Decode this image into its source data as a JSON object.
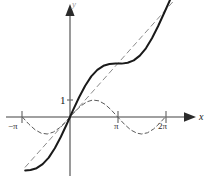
{
  "figure": {
    "title": "Graph of y = x + sin x with y = x and y = sin x",
    "background_color": "#ffffff",
    "width": 211,
    "height": 182
  },
  "axes": {
    "x_axis_label": "x",
    "y_axis_label": "y",
    "origin_px": {
      "x": 70,
      "y": 117
    },
    "x_unit_px": 47.7,
    "y_unit_px": 17.0,
    "xlim": [
      -1.47,
      2.62
    ],
    "ylim": [
      -3.9,
      6.9
    ],
    "grid": false,
    "x_ticks": [
      {
        "value": -3.14159,
        "label": "−π",
        "px_x": 22
      },
      {
        "value": 3.14159,
        "label": "π",
        "px_x": 118
      },
      {
        "value": 6.28319,
        "label": "2π",
        "px_x": 166
      }
    ],
    "y_ticks": [
      {
        "value": 1,
        "label": "1",
        "px_y": 100
      }
    ]
  },
  "chart_data": {
    "type": "line",
    "title": "",
    "xlabel": "x",
    "ylabel": "y",
    "xlim": [
      -4.62,
      8.22
    ],
    "ylim": [
      -6.6,
      11.7
    ],
    "grid": false,
    "legend_position": "none",
    "series": [
      {
        "name": "y = x + sin x",
        "style": "solid",
        "color": "#1a1a1a",
        "expression": "x + sin(x)",
        "x": [
          -2.95,
          -2.6,
          -2.2,
          -1.8,
          -1.4,
          -1.0,
          -0.6,
          -0.2,
          0.0,
          0.2,
          0.6,
          1.0,
          1.4,
          1.8,
          2.2,
          2.6,
          3.0,
          3.4,
          3.8,
          4.2,
          4.6,
          5.0,
          5.4,
          5.8,
          6.2,
          6.6,
          6.95
        ],
        "y": [
          -3.14,
          -3.12,
          -3.01,
          -2.77,
          -2.39,
          -1.84,
          -1.16,
          -0.4,
          0.0,
          0.4,
          1.16,
          1.84,
          2.39,
          2.77,
          3.01,
          3.12,
          3.14,
          3.14,
          3.19,
          3.33,
          3.61,
          4.04,
          4.63,
          5.34,
          6.12,
          6.91,
          7.56
        ]
      },
      {
        "name": "y = x",
        "style": "dashed",
        "color": "#8a8a8a",
        "expression": "x",
        "x": [
          -2.95,
          6.95
        ],
        "y": [
          -2.95,
          6.95
        ]
      },
      {
        "name": "y = sin x",
        "style": "dashed",
        "color": "#5a5a5a",
        "expression": "sin(x)",
        "x": [
          -3.14,
          -2.7,
          -2.3,
          -1.9,
          -1.5,
          -1.1,
          -0.7,
          -0.3,
          0.0,
          0.3,
          0.7,
          1.1,
          1.5,
          1.9,
          2.3,
          2.7,
          3.14,
          3.6,
          4.0,
          4.4,
          4.71,
          5.1,
          5.5,
          5.9,
          6.28
        ],
        "y": [
          0.0,
          -0.43,
          -0.75,
          -0.95,
          -1.0,
          -0.89,
          -0.64,
          -0.3,
          0.0,
          0.3,
          0.64,
          0.89,
          1.0,
          0.95,
          0.75,
          0.43,
          0.0,
          -0.44,
          -0.76,
          -0.95,
          -1.0,
          -0.93,
          -0.71,
          -0.37,
          0.0
        ]
      }
    ],
    "annotations": [
      {
        "text": "1",
        "x": -0.18,
        "y": 1.0,
        "role": "y-axis-unit-marker"
      },
      {
        "text": "−π",
        "x": -3.14159,
        "y": -0.75,
        "role": "x-tick-label"
      },
      {
        "text": "π",
        "x": 3.14159,
        "y": -0.75,
        "role": "x-tick-label"
      },
      {
        "text": "2π",
        "x": 6.28319,
        "y": -0.75,
        "role": "x-tick-label"
      },
      {
        "text": "x",
        "x": 8.0,
        "y": 0.55,
        "role": "axis-name"
      },
      {
        "text": "y",
        "x": 0.25,
        "y": 11.2,
        "role": "axis-name"
      }
    ]
  }
}
